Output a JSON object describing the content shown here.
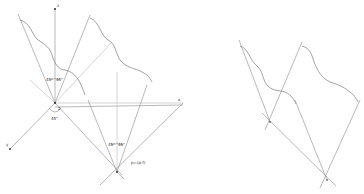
{
  "diagram": {
    "left_panel": {
      "axis_labels": {
        "z_top": "z",
        "x_right": "x",
        "y_left": "y"
      },
      "angle_labels": [
        "45°",
        "45°",
        "45°"
      ],
      "bottom_angle_labels": [
        "45°",
        "45°"
      ],
      "point_label": "p=(p-f)",
      "origin_marker": "2"
    },
    "right_panel": {
      "description": "Two wavy boundary curves with reflected rays meeting at two intersection points"
    }
  }
}
